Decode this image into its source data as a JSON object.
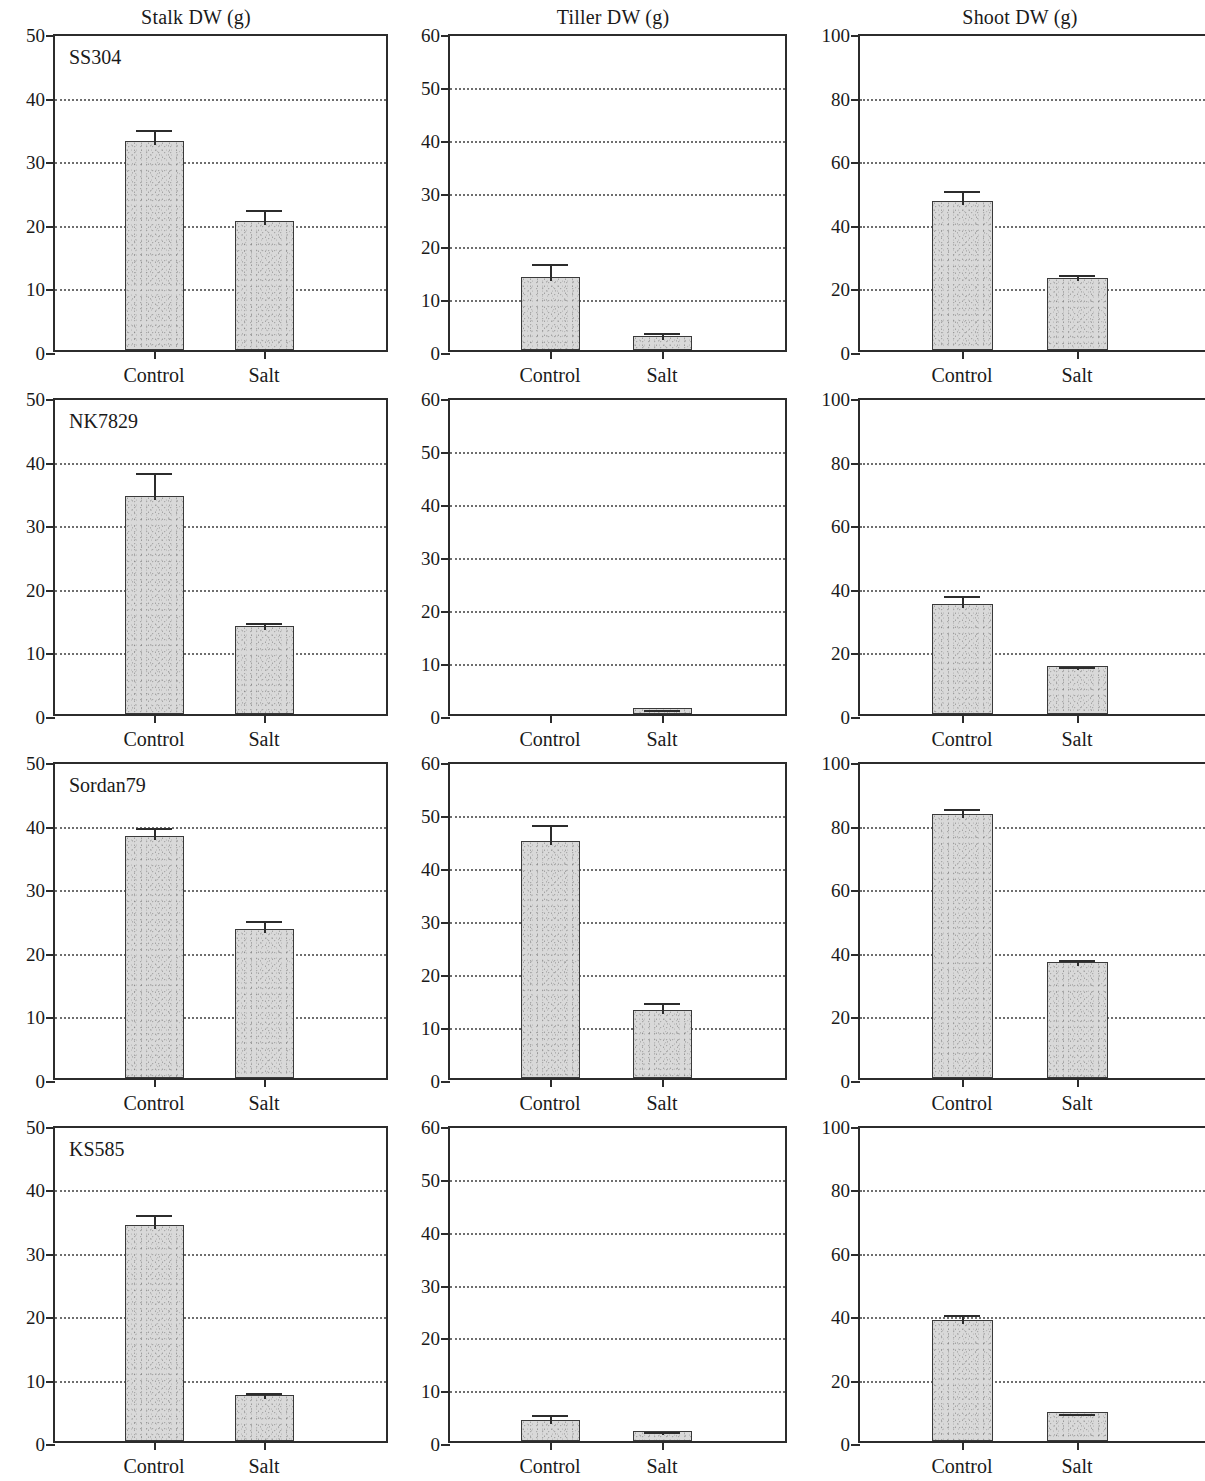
{
  "figure": {
    "column_titles": [
      "Stalk DW (g)",
      "Tiller DW (g)",
      "Shoot DW (g)"
    ],
    "row_labels": [
      "SS304",
      "NK7829",
      "Sordan79",
      "KS585"
    ],
    "x_categories": [
      "Control",
      "Salt"
    ],
    "colors": {
      "bar_fill": "#d9d9d9",
      "bar_edge": "#3a3a3a",
      "axis": "#2c2c2c",
      "grid": "#6e6e6e",
      "text": "#1a1a1a",
      "background": "#ffffff"
    },
    "axis_ticks": {
      "stalk": [
        "0",
        "10",
        "20",
        "30",
        "40",
        "50"
      ],
      "tiller": [
        "0",
        "10",
        "20",
        "30",
        "40",
        "50",
        "60"
      ],
      "shoot": [
        "0",
        "20",
        "40",
        "60",
        "80",
        "100"
      ]
    }
  },
  "chart_data": [
    {
      "type": "bar",
      "title": "Stalk DW (g)",
      "panel_label": "SS304",
      "xlabel": "",
      "ylabel": "Stalk DW (g)",
      "categories": [
        "Control",
        "Salt"
      ],
      "values": [
        32.9,
        20.3
      ],
      "errors": [
        2.3,
        2.3
      ],
      "ylim": [
        0,
        50
      ],
      "yticks": [
        0,
        10,
        20,
        30,
        40,
        50
      ],
      "grid": true,
      "legend": "none"
    },
    {
      "type": "bar",
      "title": "Tiller DW (g)",
      "panel_label": "SS304",
      "xlabel": "",
      "ylabel": "Tiller DW (g)",
      "categories": [
        "Control",
        "Salt"
      ],
      "values": [
        13.8,
        2.7
      ],
      "errors": [
        3.2,
        1.3
      ],
      "ylim": [
        0,
        60
      ],
      "yticks": [
        0,
        10,
        20,
        30,
        40,
        50,
        60
      ],
      "grid": true,
      "legend": "none"
    },
    {
      "type": "bar",
      "title": "Shoot DW (g)",
      "panel_label": "SS304",
      "xlabel": "",
      "ylabel": "Shoot DW (g)",
      "categories": [
        "Control",
        "Salt"
      ],
      "values": [
        46.8,
        22.8
      ],
      "errors": [
        4.4,
        2.2
      ],
      "ylim": [
        0,
        100
      ],
      "yticks": [
        0,
        20,
        40,
        60,
        80,
        100
      ],
      "grid": true,
      "legend": "none"
    },
    {
      "type": "bar",
      "title": "Stalk DW (g)",
      "panel_label": "NK7829",
      "xlabel": "",
      "ylabel": "Stalk DW (g)",
      "categories": [
        "Control",
        "Salt"
      ],
      "values": [
        34.3,
        13.8
      ],
      "errors": [
        4.2,
        1.2
      ],
      "ylim": [
        0,
        50
      ],
      "yticks": [
        0,
        10,
        20,
        30,
        40,
        50
      ],
      "grid": true,
      "legend": "none"
    },
    {
      "type": "bar",
      "title": "Tiller DW (g)",
      "panel_label": "NK7829",
      "xlabel": "",
      "ylabel": "Tiller DW (g)",
      "categories": [
        "Control",
        "Salt"
      ],
      "values": [
        0.0,
        1.1
      ],
      "errors": [
        0.0,
        0.4
      ],
      "ylim": [
        0,
        60
      ],
      "yticks": [
        0,
        10,
        20,
        30,
        40,
        50,
        60
      ],
      "grid": true,
      "legend": "none"
    },
    {
      "type": "bar",
      "title": "Shoot DW (g)",
      "panel_label": "NK7829",
      "xlabel": "",
      "ylabel": "Shoot DW (g)",
      "categories": [
        "Control",
        "Salt"
      ],
      "values": [
        34.5,
        15.0
      ],
      "errors": [
        4.0,
        0.9
      ],
      "ylim": [
        0,
        100
      ],
      "yticks": [
        0,
        20,
        40,
        60,
        80,
        100
      ],
      "grid": true,
      "legend": "none"
    },
    {
      "type": "bar",
      "title": "Stalk DW (g)",
      "panel_label": "Sordan79",
      "xlabel": "",
      "ylabel": "Stalk DW (g)",
      "categories": [
        "Control",
        "Salt"
      ],
      "values": [
        38.1,
        23.5
      ],
      "errors": [
        1.8,
        1.8
      ],
      "ylim": [
        0,
        50
      ],
      "yticks": [
        0,
        10,
        20,
        30,
        40,
        50
      ],
      "grid": true,
      "legend": "none"
    },
    {
      "type": "bar",
      "title": "Tiller DW (g)",
      "panel_label": "Sordan79",
      "xlabel": "",
      "ylabel": "Tiller DW (g)",
      "categories": [
        "Control",
        "Salt"
      ],
      "values": [
        44.7,
        12.8
      ],
      "errors": [
        3.8,
        2.2
      ],
      "ylim": [
        0,
        60
      ],
      "yticks": [
        0,
        10,
        20,
        30,
        40,
        50,
        60
      ],
      "grid": true,
      "legend": "none"
    },
    {
      "type": "bar",
      "title": "Shoot DW (g)",
      "panel_label": "Sordan79",
      "xlabel": "",
      "ylabel": "Shoot DW (g)",
      "categories": [
        "Control",
        "Salt"
      ],
      "values": [
        82.9,
        36.4
      ],
      "errors": [
        3.1,
        2.1
      ],
      "ylim": [
        0,
        100
      ],
      "yticks": [
        0,
        20,
        40,
        60,
        80,
        100
      ],
      "grid": true,
      "legend": "none"
    },
    {
      "type": "bar",
      "title": "Stalk DW (g)",
      "panel_label": "KS585",
      "xlabel": "",
      "ylabel": "Stalk DW (g)",
      "categories": [
        "Control",
        "Salt"
      ],
      "values": [
        34.1,
        7.3
      ],
      "errors": [
        2.2,
        0.9
      ],
      "ylim": [
        0,
        50
      ],
      "yticks": [
        0,
        10,
        20,
        30,
        40,
        50
      ],
      "grid": true,
      "legend": "none"
    },
    {
      "type": "bar",
      "title": "Tiller DW (g)",
      "panel_label": "KS585",
      "xlabel": "",
      "ylabel": "Tiller DW (g)",
      "categories": [
        "Control",
        "Salt"
      ],
      "values": [
        3.9,
        1.9
      ],
      "errors": [
        1.7,
        0.5
      ],
      "ylim": [
        0,
        60
      ],
      "yticks": [
        0,
        10,
        20,
        30,
        40,
        50,
        60
      ],
      "grid": true,
      "legend": "none"
    },
    {
      "type": "bar",
      "title": "Shoot DW (g)",
      "panel_label": "KS585",
      "xlabel": "",
      "ylabel": "Shoot DW (g)",
      "categories": [
        "Control",
        "Salt"
      ],
      "values": [
        38.3,
        9.1
      ],
      "errors": [
        2.7,
        0.8
      ],
      "ylim": [
        0,
        100
      ],
      "yticks": [
        0,
        20,
        40,
        60,
        80,
        100
      ],
      "grid": true,
      "legend": "none"
    }
  ]
}
